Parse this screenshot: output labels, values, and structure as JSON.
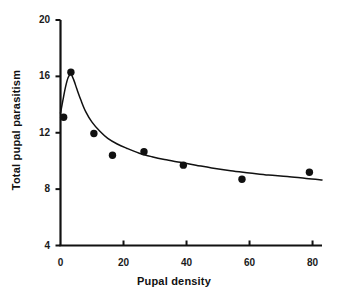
{
  "chart_data": {
    "type": "scatter",
    "title": "",
    "xlabel": "Pupal density",
    "ylabel": "Total pupal parasitism",
    "xlim": [
      0,
      83
    ],
    "ylim": [
      4,
      20
    ],
    "xticks": [
      0,
      20,
      40,
      60,
      80
    ],
    "yticks": [
      4,
      8,
      12,
      16,
      20
    ],
    "xtick_labels": [
      "0",
      "20",
      "40",
      "60",
      "80"
    ],
    "ytick_labels": [
      "4",
      "8",
      "12",
      "16",
      "20"
    ],
    "grid": false,
    "legend": null,
    "marker": {
      "shape": "circle",
      "color": "#111111",
      "size": 5
    },
    "series": [
      {
        "name": "Observed total pupal parasitism",
        "type": "scatter",
        "x": [
          1.0,
          3.3,
          10.6,
          16.5,
          26.5,
          39.0,
          57.6,
          79.0
        ],
        "y": [
          13.1,
          16.3,
          11.95,
          10.4,
          10.65,
          9.7,
          8.7,
          9.2
        ]
      },
      {
        "name": "Fitted model curve",
        "type": "line",
        "color": "#111111",
        "x": [
          0.0,
          0.8,
          1.6,
          2.4,
          3.3,
          4.2,
          5.2,
          6.5,
          8.0,
          10.0,
          12.5,
          15.0,
          18.0,
          21.0,
          25.0,
          29.0,
          33.0,
          38.0,
          43.0,
          48.0,
          54.0,
          60.0,
          66.0,
          72.0,
          78.0,
          83.0
        ],
        "y": [
          13.4,
          14.35,
          15.25,
          15.9,
          16.15,
          15.75,
          15.1,
          14.3,
          13.5,
          12.75,
          12.1,
          11.6,
          11.2,
          10.9,
          10.55,
          10.3,
          10.1,
          9.9,
          9.7,
          9.5,
          9.3,
          9.15,
          9.0,
          8.9,
          8.75,
          8.65
        ]
      }
    ]
  },
  "axes": {
    "x_axis_name": "x-axis",
    "y_axis_name": "y-axis"
  }
}
